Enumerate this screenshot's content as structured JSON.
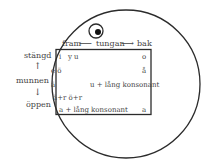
{
  "diagram": {
    "top_axis": {
      "front": "fram",
      "left_arrow": "⟵",
      "label": "tungan",
      "right_arrow": "⟶",
      "back": "bak"
    },
    "side_axis": {
      "closed": "stängd",
      "up_arrow": "↑",
      "label": "munnen",
      "down_arrow": "↓",
      "open": "öppen"
    },
    "vowels": {
      "row1_front": "i   y u",
      "row1_back": "o",
      "row2_front": "e ö",
      "row2_back": "å",
      "row3_front": "ä",
      "row3_back": "u + lång konsonant",
      "row4_front": "ä+r ö+r",
      "row5_front": "a + lång konsonant",
      "row5_back": "a"
    },
    "colors": {
      "line": "#2b2b2b",
      "text": "#444444",
      "background": "#ffffff"
    }
  }
}
